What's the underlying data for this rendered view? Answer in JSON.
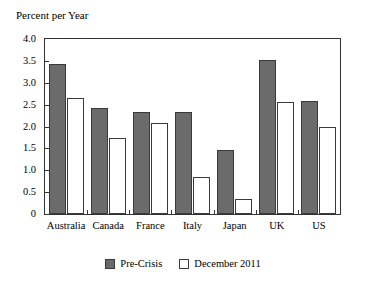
{
  "chart_data": {
    "type": "bar",
    "title": "",
    "ylabel": "Percent per Year",
    "xlabel": "",
    "ylim": [
      0,
      4.0
    ],
    "grid": false,
    "legend_position": "bottom-center",
    "y_ticks": [
      "0",
      "0.5",
      "1.0",
      "1.5",
      "2.0",
      "2.5",
      "3.0",
      "3.5",
      "4.0"
    ],
    "y_tick_values": [
      0,
      0.5,
      1.0,
      1.5,
      2.0,
      2.5,
      3.0,
      3.5,
      4.0
    ],
    "categories": [
      "Australia",
      "Canada",
      "France",
      "Italy",
      "Japan",
      "UK",
      "US"
    ],
    "series": [
      {
        "name": "Pre-Crisis",
        "color": "#6b6b6b",
        "values": [
          3.43,
          2.43,
          2.34,
          2.33,
          1.47,
          3.53,
          2.58
        ]
      },
      {
        "name": "December 2011",
        "color": "#ffffff",
        "values": [
          2.65,
          1.74,
          2.07,
          0.84,
          0.34,
          2.57,
          1.98
        ]
      }
    ]
  },
  "colors": {
    "series_pre_crisis": "#6b6b6b",
    "series_december_2011": "#ffffff",
    "axis": "#333333",
    "bar_outline": "#3a3a3a",
    "background": "#ffffff",
    "text": "#000000"
  }
}
